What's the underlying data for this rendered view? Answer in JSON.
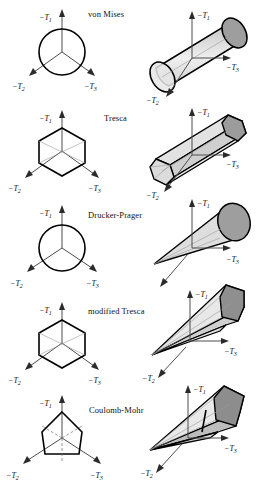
{
  "figure": {
    "caption_present": false,
    "width": 260,
    "height": 477,
    "background": "#ffffff",
    "ink": "#000000",
    "axis_color": "#4d4d4d",
    "fill_light": "#e3e3e3",
    "fill_mid": "#c9c9c9",
    "fill_dark": "#9e9e9e",
    "fill_darker": "#8a8a8a"
  },
  "axis_labels": {
    "t1": "−T",
    "t2": "−T",
    "t3": "−T",
    "sub1": "1",
    "sub2": "2",
    "sub3": "3"
  },
  "rows": [
    {
      "id": "von-mises",
      "title": "von Mises",
      "pi_plane_shape": "circle",
      "principal_shape": "cylinder",
      "left_axes": [
        "-T1",
        "-T2",
        "-T3"
      ],
      "right_axes": [
        "-T1",
        "-T2",
        "-T3"
      ]
    },
    {
      "id": "tresca",
      "title": "Tresca",
      "pi_plane_shape": "regular-hexagon",
      "principal_shape": "hexagonal-prism",
      "left_axes": [
        "-T1",
        "-T2",
        "-T3"
      ],
      "right_axes": [
        "-T1",
        "-T2",
        "-T3"
      ]
    },
    {
      "id": "drucker-prager",
      "title": "Drucker-Prager",
      "pi_plane_shape": "circle",
      "principal_shape": "cone",
      "left_axes": [
        "-T1",
        "-T2",
        "-T3"
      ],
      "right_axes": [
        "-T1",
        "-T2",
        "-T3"
      ]
    },
    {
      "id": "modified-tresca",
      "title": "modified Tresca",
      "pi_plane_shape": "regular-hexagon",
      "principal_shape": "hexagonal-pyramid",
      "left_axes": [
        "-T1",
        "-T2",
        "-T3"
      ],
      "right_axes": [
        "-T1",
        "-T2",
        "-T3"
      ]
    },
    {
      "id": "coulomb-mohr",
      "title": "Coulomb-Mohr",
      "pi_plane_shape": "irregular-hexagon",
      "principal_shape": "irregular-hexagonal-pyramid",
      "left_axes": [
        "-T1",
        "-T2",
        "-T3"
      ],
      "right_axes": [
        "-T1",
        "-T2",
        "-T3"
      ]
    }
  ]
}
